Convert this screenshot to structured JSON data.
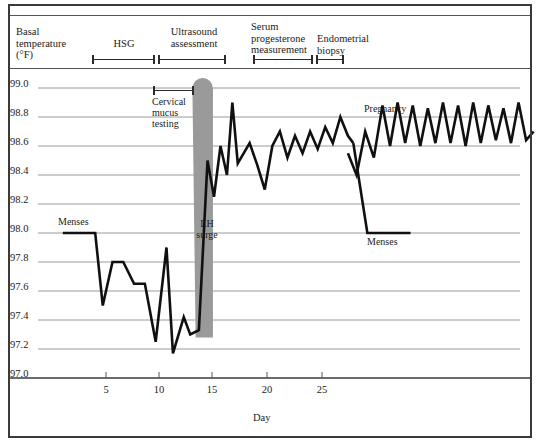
{
  "axes": {
    "y_title": "Basal\ntemperature\n(°F)",
    "y_ticks": [
      "99.0",
      "98.8",
      "98.6",
      "98.4",
      "98.2",
      "98.0",
      "97.8",
      "97.6",
      "97.4",
      "97.2",
      "97.0"
    ],
    "x_ticks": [
      "5",
      "10",
      "15",
      "20",
      "25"
    ],
    "x_caption": "Day"
  },
  "protocol": {
    "items": [
      {
        "label": "HSG",
        "start_day": 4.3,
        "end_day": 10.2
      },
      {
        "label": "Ultrasound\nassessment",
        "start_day": 10.5,
        "end_day": 16.9
      },
      {
        "label": "Serum\nprogesterone\nmeasurement",
        "start_day": 19.4,
        "end_day": 25.0
      },
      {
        "label": "Endometrial\nbiopsy",
        "start_day": 25.3,
        "end_day": 27.8
      }
    ]
  },
  "annotations": {
    "cervical_mucus": {
      "label": "Cervical\nmucus\ntesting",
      "start_day": 10.1,
      "end_day": 13.9
    },
    "lh_surge": {
      "label": "LH\nsurge"
    },
    "menses_early": {
      "label": "Menses"
    },
    "menses_late": {
      "label": "Menses"
    },
    "pregnancy": {
      "label": "Pregnancy"
    }
  },
  "colors": {
    "line": "#101010",
    "grid": "#9a9a9a",
    "band": "#9a9a9a",
    "frame": "#3a3a3a"
  },
  "chart_data": {
    "type": "line",
    "title": "",
    "xlabel": "Day",
    "ylabel": "Basal temperature (°F)",
    "xlim": [
      0.2,
      33.5
    ],
    "ylim": [
      97.0,
      99.0
    ],
    "grid": true,
    "legend": "none",
    "series": [
      {
        "name": "Basal body temperature — cycle 1 (conception cycle)",
        "x": [
          1.0,
          2.0,
          3.0,
          4.0,
          4.7,
          5.6,
          6.6,
          7.6,
          8.6,
          9.6,
          10.6,
          11.2,
          12.2,
          12.8,
          13.6,
          14.4,
          15.0,
          15.6,
          16.2,
          16.7,
          17.2,
          18.3,
          19.0,
          19.7,
          20.4,
          21.1,
          21.8,
          22.5,
          23.2,
          23.9,
          24.6,
          25.3,
          26.0,
          26.7,
          27.4,
          27.9
        ],
        "y": [
          98.0,
          98.0,
          98.0,
          98.0,
          97.5,
          97.8,
          97.8,
          97.65,
          97.65,
          97.25,
          97.9,
          97.17,
          97.42,
          97.3,
          97.33,
          98.5,
          98.25,
          98.6,
          98.4,
          98.9,
          98.48,
          98.62,
          98.47,
          98.3,
          98.6,
          98.7,
          98.52,
          98.67,
          98.55,
          98.7,
          98.58,
          98.73,
          98.62,
          98.8,
          98.67,
          98.62
        ]
      },
      {
        "name": "Menses drop (end of cycle 1)",
        "x": [
          27.9,
          29.2,
          33.2
        ],
        "y": [
          98.62,
          98.0,
          98.0
        ]
      },
      {
        "name": "Pregnancy — sustained elevation",
        "x": [
          27.4,
          28.2,
          29.0,
          29.8,
          30.6,
          31.3,
          32.0,
          32.7,
          33.4,
          34.1,
          34.8,
          35.5,
          36.2,
          36.9,
          37.6,
          38.3,
          39.0,
          39.7,
          40.4,
          41.1,
          41.8,
          42.5,
          43.2,
          43.9,
          44.6
        ],
        "y": [
          98.55,
          98.4,
          98.7,
          98.52,
          98.88,
          98.6,
          98.9,
          98.62,
          98.88,
          98.6,
          98.86,
          98.62,
          98.9,
          98.62,
          98.88,
          98.6,
          98.9,
          98.62,
          98.88,
          98.64,
          98.86,
          98.62,
          98.9,
          98.64,
          98.7
        ]
      }
    ],
    "bands": [
      {
        "name": "LH surge",
        "x_top_start": 13.0,
        "x_top_end": 14.9,
        "x_bottom_start": 13.3,
        "x_bottom_end": 14.9,
        "y_top": 99.15,
        "y_bottom": 97.28,
        "color": "#9a9a9a"
      }
    ],
    "notes": [
      "Biphasic basal body temperature curve across a conception cycle.",
      "Follicular phase temperatures ~97.2–98.0 °F; post-ovulatory rise to ~98.5–98.9 °F.",
      "LH surge shaded band at days ~13–15 precedes the thermal shift.",
      "Sustained elevation beyond expected menses indicates pregnancy."
    ]
  }
}
